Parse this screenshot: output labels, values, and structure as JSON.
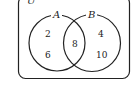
{
  "diagram": {
    "type": "venn",
    "universal_label": "U",
    "sets": [
      {
        "name": "A",
        "only": [
          "2",
          "6"
        ]
      },
      {
        "name": "B",
        "only": [
          "4",
          "10"
        ]
      }
    ],
    "intersection": [
      "8"
    ],
    "colors": {
      "stroke": "#222222",
      "background": "#ffffff"
    }
  }
}
